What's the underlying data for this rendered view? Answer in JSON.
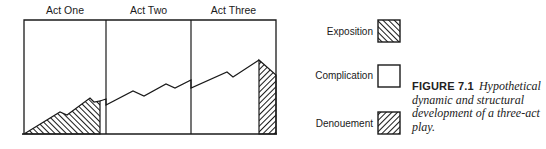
{
  "figure": {
    "number": "FIGURE 7.1",
    "caption": "Hypothetical dynamic and structural development of a three-act play."
  },
  "acts": [
    {
      "label": "Act One"
    },
    {
      "label": "Act Two"
    },
    {
      "label": "Act Three"
    }
  ],
  "legend": {
    "items": [
      {
        "label": "Exposition",
        "pattern": "hatch-backslash"
      },
      {
        "label": "Complication",
        "pattern": "none"
      },
      {
        "label": "Denouement",
        "pattern": "hatch-slash"
      }
    ]
  },
  "colors": {
    "ink": "#1a1a1a",
    "background": "#ffffff"
  },
  "chart_data": {
    "type": "line",
    "title": "Hypothetical dynamic and structural development of a three-act play",
    "xlabel": "",
    "ylabel": "",
    "categories": [
      "Act One",
      "Act Two",
      "Act Three"
    ],
    "grid": false,
    "legend_position": "right",
    "frame": {
      "left": 24,
      "top": 20,
      "right": 276,
      "bottom": 134
    },
    "act_dividers_x": [
      106,
      191
    ],
    "series": [
      {
        "name": "Exposition",
        "segment": "Act One",
        "fill": "hatch-backslash",
        "points": [
          [
            24,
            134
          ],
          [
            60,
            112
          ],
          [
            67,
            115
          ],
          [
            90,
            98
          ],
          [
            94,
            102
          ],
          [
            100,
            101
          ]
        ]
      },
      {
        "name": "Complication",
        "segment": "Act One end - Act Three",
        "fill": "none",
        "points": [
          [
            100,
            101
          ],
          [
            106,
            99
          ],
          [
            106,
            105
          ],
          [
            133,
            91
          ],
          [
            144,
            96
          ],
          [
            166,
            84
          ],
          [
            175,
            88
          ],
          [
            191,
            80
          ],
          [
            191,
            88
          ],
          [
            227,
            72
          ],
          [
            233,
            77
          ],
          [
            259,
            60
          ]
        ]
      },
      {
        "name": "Denouement",
        "segment": "Act Three",
        "fill": "hatch-slash",
        "points": [
          [
            259,
            60
          ],
          [
            276,
            75
          ],
          [
            276,
            134
          ],
          [
            259,
            134
          ]
        ]
      }
    ]
  }
}
